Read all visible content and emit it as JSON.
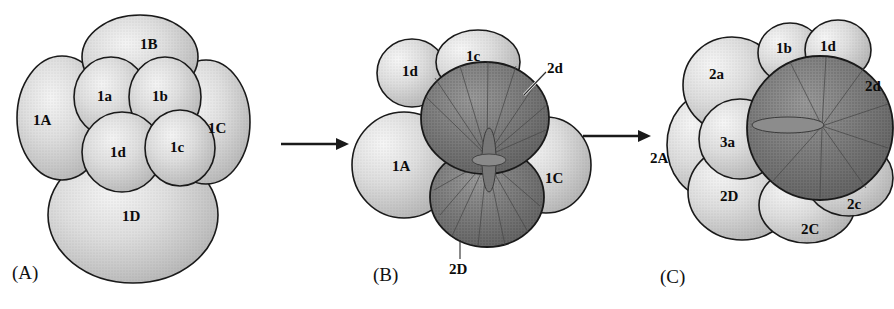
{
  "figure": {
    "title_fragment": "",
    "caption_top": "",
    "type": "biological-diagram",
    "background_color": "#ffffff",
    "outline_color": "#1a1a1a",
    "cell_fill_light": "#c8c8c8",
    "cell_fill_light_highlight": "#f2f2f2",
    "cell_fill_dark": "#6e6e6e",
    "cell_fill_dark_highlight": "#8e8e8e",
    "label_color": "#0b0b0b"
  },
  "panels": [
    {
      "id": "A",
      "label": "(A)",
      "label_x": 12,
      "label_y": 268,
      "cells": [
        {
          "name": "1B",
          "x": 140,
          "y": 36,
          "shade": "light"
        },
        {
          "name": "1a",
          "x": 106,
          "y": 92,
          "shade": "light"
        },
        {
          "name": "1b",
          "x": 158,
          "y": 92,
          "shade": "light"
        },
        {
          "name": "1A",
          "x": 38,
          "y": 117,
          "shade": "light"
        },
        {
          "name": "1C",
          "x": 213,
          "y": 126,
          "shade": "light"
        },
        {
          "name": "1d",
          "x": 118,
          "y": 147,
          "shade": "light"
        },
        {
          "name": "1c",
          "x": 175,
          "y": 143,
          "shade": "light"
        },
        {
          "name": "1D",
          "x": 128,
          "y": 218,
          "shade": "light"
        }
      ]
    },
    {
      "id": "B",
      "label": "(B)",
      "label_x": 373,
      "label_y": 270,
      "cells": [
        {
          "name": "1d",
          "x": 409,
          "y": 68,
          "shade": "light"
        },
        {
          "name": "1c",
          "x": 472,
          "y": 54,
          "shade": "light"
        },
        {
          "name": "2d",
          "x": 550,
          "y": 66,
          "shade": "dark",
          "leader": true
        },
        {
          "name": "1A",
          "x": 399,
          "y": 163,
          "shade": "light"
        },
        {
          "name": "1C",
          "x": 551,
          "y": 176,
          "shade": "light"
        },
        {
          "name": "2D",
          "x": 455,
          "y": 270,
          "shade": "dark",
          "leader": true
        }
      ]
    },
    {
      "id": "C",
      "label": "(C)",
      "label_x": 660,
      "label_y": 272,
      "cells": [
        {
          "name": "1b",
          "x": 782,
          "y": 46,
          "shade": "light"
        },
        {
          "name": "1d",
          "x": 826,
          "y": 45,
          "shade": "light"
        },
        {
          "name": "2a",
          "x": 716,
          "y": 72,
          "shade": "light"
        },
        {
          "name": "2d",
          "x": 870,
          "y": 85,
          "shade": "dark"
        },
        {
          "name": "3a",
          "x": 727,
          "y": 142,
          "shade": "light"
        },
        {
          "name": "2A",
          "x": 654,
          "y": 157,
          "shade": "light"
        },
        {
          "name": "2D",
          "x": 727,
          "y": 195,
          "shade": "light"
        },
        {
          "name": "2c",
          "x": 852,
          "y": 203,
          "shade": "light"
        },
        {
          "name": "2C",
          "x": 807,
          "y": 228,
          "shade": "light"
        }
      ]
    }
  ],
  "arrows": [
    {
      "id": "arrow-a-to-b",
      "x1": 281,
      "y1": 144,
      "x2": 342,
      "y2": 144
    },
    {
      "id": "arrow-b-to-c",
      "x1": 583,
      "y1": 136,
      "x2": 646,
      "y2": 136
    }
  ]
}
